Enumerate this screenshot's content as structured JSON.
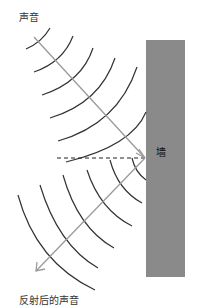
{
  "labels": {
    "incident": "声音",
    "reflected": "反射后的声音",
    "wall": "墙"
  },
  "colors": {
    "wall": "#8a8a8a",
    "ray": "#9a9a9a",
    "wave": "#333333",
    "normal": "#222222"
  },
  "geometry": {
    "wall": {
      "x": 146,
      "y": 40,
      "width": 39,
      "height": 237
    },
    "incident_ray": {
      "x1": 34,
      "y1": 37,
      "x2": 145,
      "y2": 158
    },
    "reflected_ray": {
      "x1": 145,
      "y1": 158,
      "x2": 36,
      "y2": 271
    },
    "normal_line": {
      "x1": 57,
      "y1": 158,
      "x2": 145,
      "y2": 158
    }
  }
}
